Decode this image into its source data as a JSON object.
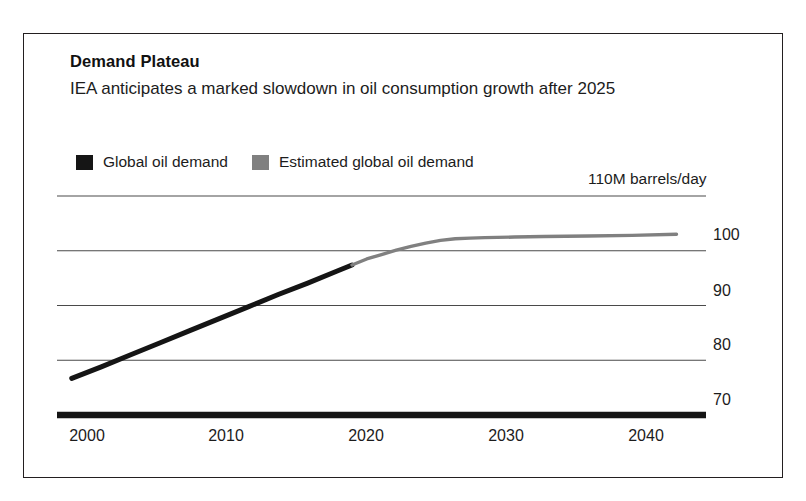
{
  "figure": {
    "title": "Demand Plateau",
    "subtitle": "IEA anticipates a marked slowdown in oil consumption growth after 2025",
    "frame_color": "#231f20",
    "background": "#ffffff"
  },
  "legend": {
    "position": "top-left",
    "items": [
      {
        "label": "Global oil demand",
        "color": "#151515",
        "swatch": "legend-swatch-actual"
      },
      {
        "label": "Estimated global oil demand",
        "color": "#808080",
        "swatch": "legend-swatch-estimated"
      }
    ]
  },
  "axes": {
    "y_unit_label": "110M barrels/day",
    "y_ticks": [
      "110",
      "100",
      "90",
      "80",
      "70"
    ],
    "y_tick_values": [
      110,
      100,
      90,
      80,
      70
    ],
    "y_visible_labels": [
      "110M barrels/day",
      "100",
      "90",
      "80",
      "70"
    ],
    "x_ticks": [
      "2000",
      "2010",
      "2020",
      "2030",
      "2040"
    ],
    "x_tick_values": [
      2000,
      2010,
      2020,
      2030,
      2040
    ]
  },
  "chart_data": {
    "type": "line",
    "title": "Demand Plateau",
    "subtitle": "IEA anticipates a marked slowdown in oil consumption growth after 2025",
    "xlabel": "",
    "ylabel": "110M barrels/day",
    "xlim": [
      1999,
      2043
    ],
    "ylim": [
      70,
      110
    ],
    "grid": true,
    "grid_axis": "y",
    "legend_position": "top-left",
    "x_ticks": [
      2000,
      2010,
      2020,
      2030,
      2040
    ],
    "y_ticks": [
      70,
      80,
      90,
      100,
      110
    ],
    "series": [
      {
        "name": "Global oil demand",
        "color": "#151515",
        "x": [
          2000,
          2002,
          2004,
          2006,
          2008,
          2010,
          2012,
          2014,
          2016,
          2018,
          2019
        ],
        "values": [
          76.7,
          78.8,
          81.0,
          83.2,
          85.4,
          87.6,
          89.8,
          92.0,
          94.1,
          96.3,
          97.4
        ]
      },
      {
        "name": "Estimated global oil demand",
        "color": "#808080",
        "x": [
          2019,
          2020,
          2021,
          2022,
          2023,
          2024,
          2025,
          2026,
          2027,
          2028,
          2030,
          2032,
          2035,
          2038,
          2041
        ],
        "values": [
          97.4,
          98.5,
          99.3,
          100.1,
          100.8,
          101.4,
          101.9,
          102.2,
          102.3,
          102.4,
          102.5,
          102.6,
          102.7,
          102.8,
          103.0
        ]
      }
    ],
    "annotations": [
      {
        "text": "110M barrels/day",
        "position": "above-top-gridline-right"
      }
    ]
  }
}
